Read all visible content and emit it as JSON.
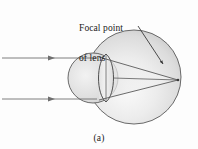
{
  "figure": {
    "caption": "(a)",
    "annotation": {
      "name": "focal-point-of-lens",
      "line1": "Focal point",
      "line2": "of lens"
    },
    "colors": {
      "background": "#fdfdfd",
      "stroke": "#4a4a4a",
      "ray_stroke": "#6b6b6b",
      "eyeball_light": "#f4f4f4",
      "eyeball_mid": "#d8d8d8",
      "eyeball_dark": "#b9b9b9",
      "lens_fill": "#e6e6e6",
      "text": "#1a1a1a"
    },
    "parts": [
      {
        "name": "eyeball",
        "shape": "circle",
        "cx": 134,
        "cy": 77,
        "r": 47
      },
      {
        "name": "cornea",
        "shape": "circle",
        "cx": 93,
        "cy": 78,
        "r": 25
      },
      {
        "name": "lens",
        "shape": "biconvex",
        "cx": 106,
        "cy": 78,
        "half_width": 11,
        "half_height": 24
      },
      {
        "name": "focal-point",
        "shape": "point",
        "x": 178,
        "y": 80
      }
    ],
    "rays": {
      "incident": [
        {
          "name": "incident-ray-upper",
          "x1": 2,
          "y1": 58,
          "x2": 96,
          "y2": 58,
          "arrow_at_x": 52
        },
        {
          "name": "incident-ray-lower",
          "x1": 2,
          "y1": 99,
          "x2": 96,
          "y2": 99,
          "arrow_at_x": 52
        }
      ],
      "refracted": [
        {
          "name": "refracted-ray-upper",
          "x1": 99,
          "y1": 57,
          "x2": 178,
          "y2": 80
        },
        {
          "name": "refracted-ray-lower",
          "x1": 99,
          "y1": 100,
          "x2": 178,
          "y2": 80
        },
        {
          "name": "axis-ray",
          "x1": 112,
          "y1": 79,
          "x2": 178,
          "y2": 80
        }
      ]
    },
    "leader": {
      "name": "focal-point-leader-arrow",
      "x1": 139,
      "y1": 27,
      "x2": 162,
      "y2": 62,
      "arrowhead": true
    }
  }
}
